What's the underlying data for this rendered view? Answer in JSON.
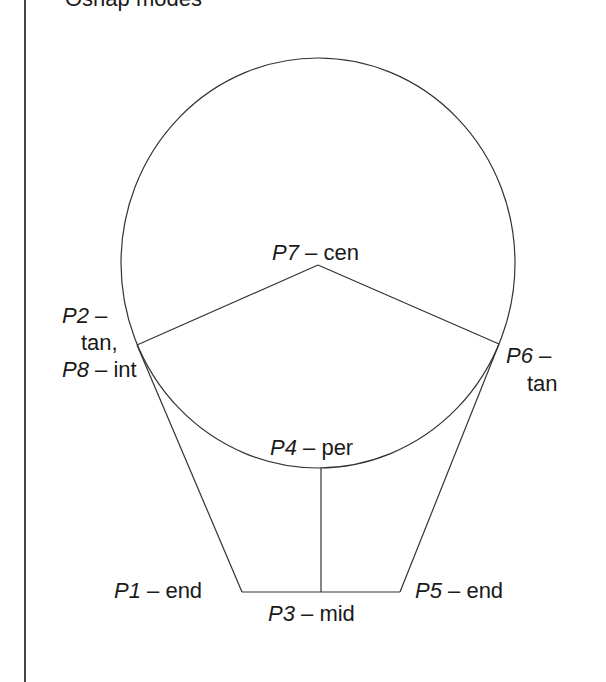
{
  "page": {
    "truncated_title": "Osnap modes"
  },
  "diagram": {
    "type": "geometry-osnap-diagram",
    "stroke_color": "#333333",
    "circle": {
      "cx": 318,
      "cy": 263,
      "rx": 197,
      "ry": 205
    },
    "points": [
      {
        "id": "P1",
        "mode": "end",
        "x": 242,
        "y": 592
      },
      {
        "id": "P2",
        "mode": "tan",
        "x": 137,
        "y": 345
      },
      {
        "id": "P3",
        "mode": "mid",
        "x": 321,
        "y": 592
      },
      {
        "id": "P4",
        "mode": "per",
        "x": 321,
        "y": 468
      },
      {
        "id": "P5",
        "mode": "end",
        "x": 400,
        "y": 592
      },
      {
        "id": "P6",
        "mode": "tan",
        "x": 499,
        "y": 344
      },
      {
        "id": "P7",
        "mode": "cen",
        "x": 318,
        "y": 265
      },
      {
        "id": "P8",
        "mode": "int",
        "x": 137,
        "y": 345
      }
    ],
    "labels": {
      "p7": {
        "pid": "P7",
        "sep": " – ",
        "mode": "cen"
      },
      "p2": {
        "pid": "P2",
        "sep": " –",
        "mode": "tan,"
      },
      "p8": {
        "pid": "P8",
        "sep": " – ",
        "mode": "int"
      },
      "p6": {
        "pid": "P6",
        "sep": " –",
        "mode": "tan"
      },
      "p4": {
        "pid": "P4",
        "sep": " – ",
        "mode": "per"
      },
      "p1": {
        "pid": "P1",
        "sep": " – ",
        "mode": "end"
      },
      "p3": {
        "pid": "P3",
        "sep": " – ",
        "mode": "mid"
      },
      "p5": {
        "pid": "P5",
        "sep": " – ",
        "mode": "end"
      }
    }
  }
}
